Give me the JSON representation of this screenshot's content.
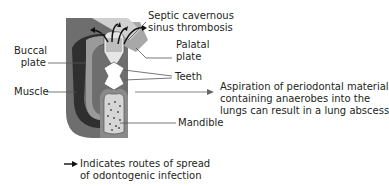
{
  "labels": {
    "septic": [
      "Septic cavernous",
      "sinus thrombosis"
    ],
    "palatal": [
      "Palatal",
      "plate"
    ],
    "buccal": [
      "Buccal",
      "plate"
    ],
    "teeth": "Teeth",
    "muscle": "Muscle",
    "mandible": "Mandible",
    "aspiration": [
      "Aspiration of periodontal material",
      "containing anaerobes into the",
      "lungs can result in a lung abscess"
    ]
  },
  "legend": {
    "icon": "arrow-right-icon",
    "text": [
      "Indicates routes of spread",
      "of odontogenic infection"
    ]
  },
  "colors": {
    "dark_gray": "#5e5e5e",
    "mid_gray": "#8c8c8c",
    "light_gray": "#c8c8c8",
    "muscle_dark": "#3a3a3a",
    "text": "#231f20",
    "leader": "#555555"
  }
}
